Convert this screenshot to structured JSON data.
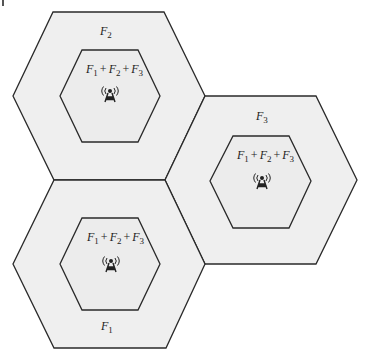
{
  "diagram": {
    "type": "hexagonal-cell-frequency-reuse",
    "colors": {
      "cell_fill": "#efefef",
      "stroke": "#2a2a2a",
      "background": "#ffffff"
    },
    "cells": [
      {
        "id": "cell-top",
        "outer_label": {
          "base": "F",
          "sub": "2"
        },
        "inner_label": {
          "terms": [
            {
              "base": "F",
              "sub": "1"
            },
            {
              "base": "F",
              "sub": "2"
            },
            {
              "base": "F",
              "sub": "3"
            }
          ],
          "operator": "+"
        },
        "icon": "antenna-tower-icon"
      },
      {
        "id": "cell-right",
        "outer_label": {
          "base": "F",
          "sub": "3"
        },
        "inner_label": {
          "terms": [
            {
              "base": "F",
              "sub": "1"
            },
            {
              "base": "F",
              "sub": "2"
            },
            {
              "base": "F",
              "sub": "3"
            }
          ],
          "operator": "+"
        },
        "icon": "antenna-tower-icon"
      },
      {
        "id": "cell-bottom",
        "outer_label": {
          "base": "F",
          "sub": "1"
        },
        "inner_label": {
          "terms": [
            {
              "base": "F",
              "sub": "1"
            },
            {
              "base": "F",
              "sub": "2"
            },
            {
              "base": "F",
              "sub": "3"
            }
          ],
          "operator": "+"
        },
        "icon": "antenna-tower-icon"
      }
    ]
  }
}
